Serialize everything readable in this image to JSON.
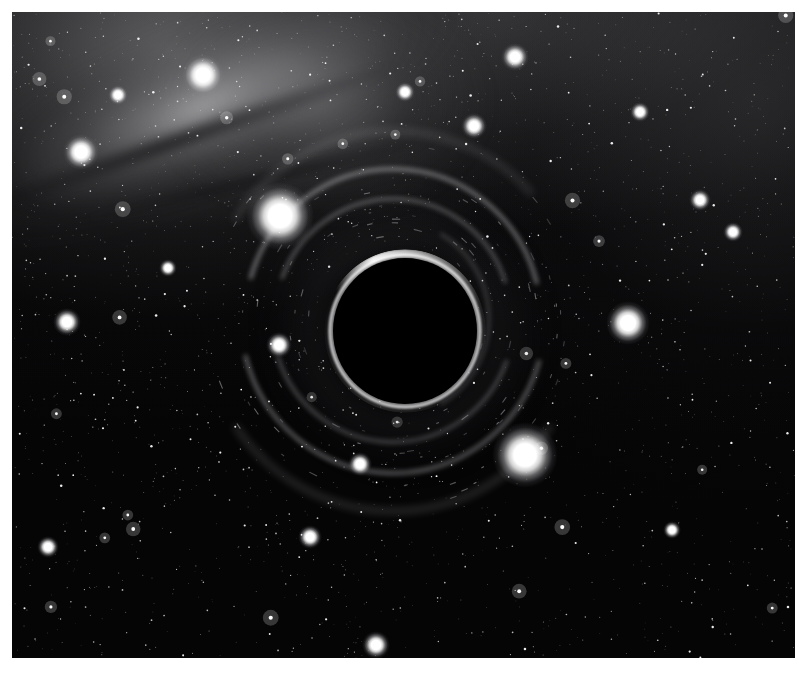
{
  "figure": {
    "frame": {
      "left": 12,
      "top": 12,
      "width": 783,
      "height": 646
    },
    "background_color": "#ffffff",
    "sky_color": "#050506"
  },
  "scene": {
    "black_hole": {
      "label": "black-hole-shadow",
      "center_x": 393,
      "center_y": 319,
      "radius_x": 72,
      "radius_y": 73,
      "shadow_color": "#000000",
      "photon_ring_color": "#ffffff"
    },
    "galaxy": {
      "label": "background-galaxy",
      "position": "upper-left",
      "tilt_degrees": -22,
      "core_color": "#cdcdcf",
      "dust_lane_color": "#0a0a0c"
    },
    "arcs": [
      {
        "name": "outer-lensed-arc-top",
        "cx": 393,
        "cy": 319,
        "rx": 148,
        "ry": 150,
        "start_deg": 196,
        "sweep_deg": 150,
        "opacity": 0.5,
        "thickness": 3.5
      },
      {
        "name": "outer-lensed-arc-bottom",
        "cx": 393,
        "cy": 319,
        "rx": 152,
        "ry": 154,
        "start_deg": 16,
        "sweep_deg": 150,
        "opacity": 0.44,
        "thickness": 3.5
      },
      {
        "name": "mid-lensed-arc-top",
        "cx": 393,
        "cy": 319,
        "rx": 118,
        "ry": 120,
        "start_deg": 200,
        "sweep_deg": 142,
        "opacity": 0.42,
        "thickness": 3.0
      },
      {
        "name": "mid-lensed-arc-bottom",
        "cx": 393,
        "cy": 319,
        "rx": 121,
        "ry": 123,
        "start_deg": 20,
        "sweep_deg": 142,
        "opacity": 0.38,
        "thickness": 3.0
      },
      {
        "name": "far-lensed-arc-bottom",
        "cx": 393,
        "cy": 319,
        "rx": 190,
        "ry": 192,
        "start_deg": 34,
        "sweep_deg": 112,
        "opacity": 0.26,
        "thickness": 4.0
      },
      {
        "name": "far-lensed-arc-top",
        "cx": 393,
        "cy": 319,
        "rx": 186,
        "ry": 188,
        "start_deg": 212,
        "sweep_deg": 106,
        "opacity": 0.22,
        "thickness": 4.0
      },
      {
        "name": "inner-halo-arc-right",
        "cx": 393,
        "cy": 319,
        "rx": 96,
        "ry": 98,
        "start_deg": 300,
        "sweep_deg": 120,
        "opacity": 0.3,
        "thickness": 2.5
      }
    ],
    "bright_stars": [
      {
        "name": "bright-star-upper-left-major",
        "x": 280,
        "y": 216,
        "radius": 34,
        "core": 15
      },
      {
        "name": "bright-star-lower-right-major",
        "x": 525,
        "y": 455,
        "radius": 33,
        "core": 14
      },
      {
        "name": "bright-star-right",
        "x": 628,
        "y": 323,
        "radius": 22,
        "core": 10
      },
      {
        "name": "bright-star-upper-left",
        "x": 203,
        "y": 75,
        "radius": 21,
        "core": 9
      },
      {
        "name": "bright-star-galaxy-edge",
        "x": 81,
        "y": 152,
        "radius": 18,
        "core": 8
      },
      {
        "name": "bright-star-top-center",
        "x": 515,
        "y": 57,
        "radius": 14,
        "core": 7
      },
      {
        "name": "bright-star-top-mid",
        "x": 474,
        "y": 126,
        "radius": 13,
        "core": 6
      },
      {
        "name": "bright-star-left-mid",
        "x": 67,
        "y": 322,
        "radius": 14,
        "core": 7
      },
      {
        "name": "bright-star-bottom-center",
        "x": 376,
        "y": 645,
        "radius": 14,
        "core": 7
      },
      {
        "name": "bright-star-left-lower",
        "x": 48,
        "y": 547,
        "radius": 11,
        "core": 5
      },
      {
        "name": "bright-star-bh-left",
        "x": 279,
        "y": 345,
        "radius": 13,
        "core": 6
      },
      {
        "name": "bright-star-bh-below",
        "x": 360,
        "y": 464,
        "radius": 12,
        "core": 6
      },
      {
        "name": "bright-star-lower-left",
        "x": 310,
        "y": 537,
        "radius": 12,
        "core": 6
      },
      {
        "name": "bright-star-upper-right",
        "x": 700,
        "y": 200,
        "radius": 11,
        "core": 5
      },
      {
        "name": "bright-star-right-upper2",
        "x": 733,
        "y": 232,
        "radius": 10,
        "core": 5
      },
      {
        "name": "bright-star-mid-right",
        "x": 640,
        "y": 112,
        "radius": 10,
        "core": 5
      },
      {
        "name": "bright-star-top-left2",
        "x": 118,
        "y": 95,
        "radius": 10,
        "core": 5
      },
      {
        "name": "bright-star-upper-mid",
        "x": 405,
        "y": 92,
        "radius": 10,
        "core": 5
      },
      {
        "name": "bright-star-mid-left2",
        "x": 168,
        "y": 268,
        "radius": 9,
        "core": 4
      },
      {
        "name": "bright-star-bottom-right",
        "x": 672,
        "y": 530,
        "radius": 9,
        "core": 4
      }
    ],
    "star_field": {
      "label": "dense-starfield",
      "approx_count": 2600,
      "color": "#ffffff"
    }
  }
}
